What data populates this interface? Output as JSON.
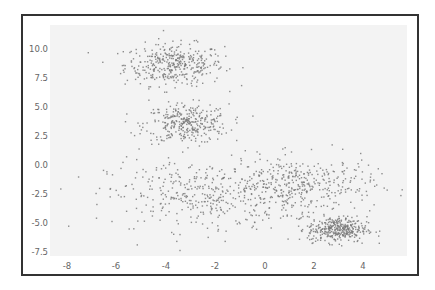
{
  "chart_data": {
    "type": "scatter",
    "title": "",
    "xlabel": "",
    "ylabel": "",
    "xlim": [
      -8.7,
      5.7
    ],
    "ylim": [
      -7.9,
      12.0
    ],
    "grid": false,
    "legend": null,
    "x_ticks": [
      "-8",
      "-6",
      "-4",
      "-2",
      "0",
      "2",
      "4"
    ],
    "y_ticks": [
      "10.0",
      "7.5",
      "5.0",
      "2.5",
      "0.0",
      "-2.5",
      "-5.0",
      "-7.5"
    ],
    "marker_color": "#7a7a7a",
    "background_color": "#f3f3f3",
    "clusters": [
      {
        "name": "cluster-top-left",
        "center": [
          -3.7,
          8.7
        ],
        "spread": [
          1.0,
          0.9
        ],
        "count": 380
      },
      {
        "name": "cluster-mid-left",
        "center": [
          -3.2,
          3.6
        ],
        "spread": [
          0.85,
          0.85
        ],
        "count": 330
      },
      {
        "name": "cluster-lower-left-band",
        "center": [
          -2.6,
          -2.6
        ],
        "spread": [
          1.9,
          1.5
        ],
        "count": 380
      },
      {
        "name": "cluster-lower-right-band",
        "center": [
          1.4,
          -1.7
        ],
        "spread": [
          1.5,
          1.2
        ],
        "count": 380
      },
      {
        "name": "cluster-bottom-right-dense",
        "center": [
          2.9,
          -5.5
        ],
        "spread": [
          0.6,
          0.55
        ],
        "count": 360
      }
    ]
  }
}
